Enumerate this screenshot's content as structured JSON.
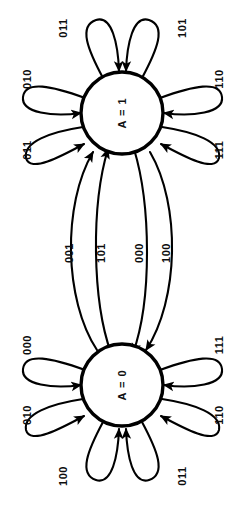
{
  "diagram": {
    "kind": "finite-state-machine",
    "orientation": "rotated-90-ccw",
    "stroke_color": "#000000",
    "fill_color": "#ffffff",
    "background": "#ffffff"
  },
  "states": [
    {
      "id": "s1",
      "label": "A = 1",
      "cx": 122,
      "cy": 113,
      "r": 41
    },
    {
      "id": "s0",
      "label": "A = 0",
      "cx": 122,
      "cy": 385,
      "r": 41
    }
  ],
  "self_loops": {
    "s1": [
      {
        "label": "011",
        "angle": -118,
        "lx": 63,
        "ly": 28
      },
      {
        "label": "010",
        "angle": -162,
        "lx": 27,
        "ly": 79
      },
      {
        "label": "011",
        "angle": 162,
        "lx": 27,
        "ly": 150
      },
      {
        "label": "101",
        "angle": -62,
        "lx": 182,
        "ly": 28
      },
      {
        "label": "110",
        "angle": -18,
        "lx": 219,
        "ly": 79
      },
      {
        "label": "111",
        "angle": 18,
        "lx": 219,
        "ly": 150
      }
    ],
    "s0": [
      {
        "label": "000",
        "angle": -162,
        "lx": 27,
        "ly": 345
      },
      {
        "label": "010",
        "angle": 162,
        "lx": 27,
        "ly": 415
      },
      {
        "label": "100",
        "angle": 118,
        "lx": 63,
        "ly": 476
      },
      {
        "label": "111",
        "angle": -18,
        "lx": 219,
        "ly": 345
      },
      {
        "label": "110",
        "angle": 18,
        "lx": 219,
        "ly": 415
      },
      {
        "label": "011",
        "angle": 62,
        "lx": 182,
        "ly": 476
      }
    ]
  },
  "transitions": [
    {
      "label": "001",
      "from": "A = 0",
      "to": "A = 1",
      "direction": "up",
      "lx": 69,
      "ly": 253
    },
    {
      "label": "101",
      "from": "A = 0",
      "to": "A = 1",
      "direction": "up",
      "lx": 101,
      "ly": 253
    },
    {
      "label": "000",
      "from": "A = 1",
      "to": "A = 0",
      "direction": "down",
      "lx": 139,
      "ly": 253
    },
    {
      "label": "100",
      "from": "A = 1",
      "to": "A = 0",
      "direction": "down",
      "lx": 166,
      "ly": 253
    }
  ]
}
